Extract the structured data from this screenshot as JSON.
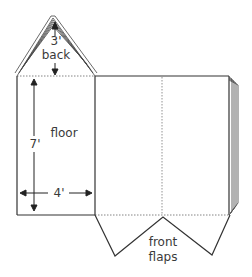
{
  "diagram": {
    "type": "net / unfolded box template",
    "labels": {
      "back_dim": "3'",
      "back": "back",
      "floor": "floor",
      "height_dim": "7'",
      "width_dim": "4'",
      "front_1": "front",
      "front_2": "flaps"
    },
    "colors": {
      "line": "#333333",
      "fold": "#666666",
      "text": "#3a3a3a"
    }
  }
}
